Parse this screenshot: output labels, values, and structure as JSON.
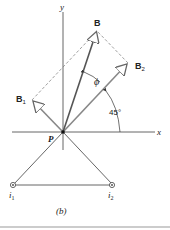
{
  "figure": {
    "caption": "(b)",
    "axes": {
      "x_label": "x",
      "y_label": "y"
    },
    "origin_label": "P",
    "vectors": {
      "resultant": {
        "label": "B"
      },
      "component_1": {
        "label": "B",
        "subscript": "1"
      },
      "component_2": {
        "label": "B",
        "subscript": "2"
      }
    },
    "angles": {
      "phi": "ϕ",
      "alpha": "45°"
    },
    "currents": [
      {
        "label": "i",
        "subscript": "1"
      },
      {
        "label": "i",
        "subscript": "2"
      }
    ]
  }
}
